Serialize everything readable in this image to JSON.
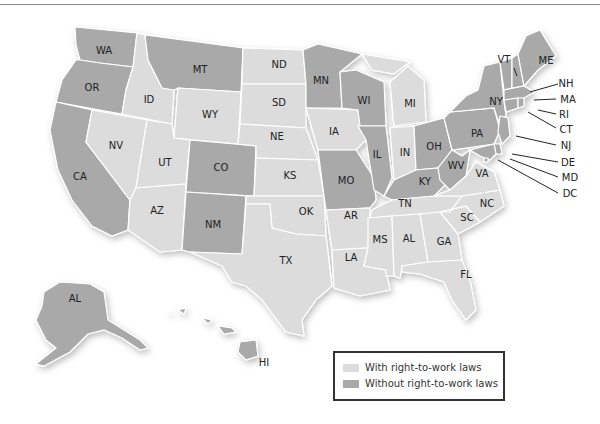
{
  "map": {
    "title": "",
    "colors": {
      "with_rtw": "#dcdcdc",
      "without_rtw": "#a9a9a9",
      "border": "#ffffff"
    },
    "legend": {
      "items": [
        {
          "label": "With right-to-work laws",
          "color": "#dcdcdc"
        },
        {
          "label": "Without right-to-work laws",
          "color": "#a9a9a9"
        }
      ]
    },
    "states": {
      "WA": "without",
      "OR": "without",
      "CA": "without",
      "ID": "with",
      "NV": "with",
      "MT": "without",
      "WY": "with",
      "UT": "with",
      "AZ": "with",
      "CO": "without",
      "NM": "without",
      "ND": "with",
      "SD": "with",
      "NE": "with",
      "KS": "with",
      "OK": "with",
      "TX": "with",
      "MN": "without",
      "IA": "with",
      "MO": "without",
      "AR": "with",
      "LA": "with",
      "WI": "without",
      "IL": "without",
      "MI": "with",
      "IN": "with",
      "OH": "without",
      "KY": "without",
      "TN": "with",
      "MS": "with",
      "AL": "with",
      "GA": "with",
      "FL": "with",
      "SC": "with",
      "NC": "with",
      "VA": "with",
      "WV": "without",
      "PA": "without",
      "NY": "without",
      "VT": "without",
      "ME": "without",
      "NH": "without",
      "MA": "without",
      "RI": "without",
      "CT": "without",
      "NJ": "without",
      "DE": "without",
      "MD": "without",
      "DC": "without",
      "AK": "without",
      "HI": "without"
    },
    "labels": {
      "WA": "WA",
      "OR": "OR",
      "CA": "CA",
      "ID": "ID",
      "NV": "NV",
      "MT": "MT",
      "WY": "WY",
      "UT": "UT",
      "AZ": "AZ",
      "CO": "CO",
      "NM": "NM",
      "ND": "ND",
      "SD": "SD",
      "NE": "NE",
      "KS": "KS",
      "OK": "OK",
      "TX": "TX",
      "MN": "MN",
      "IA": "IA",
      "MO": "MO",
      "AR": "AR",
      "LA": "LA",
      "WI": "WI",
      "IL": "IL",
      "MI": "MI",
      "IN": "IN",
      "OH": "OH",
      "KY": "KY",
      "TN": "TN",
      "MS": "MS",
      "AL": "AL",
      "GA": "GA",
      "FL": "FL",
      "SC": "SC",
      "NC": "NC",
      "VA": "VA",
      "WV": "WV",
      "PA": "PA",
      "NY": "NY",
      "VT": "VT",
      "ME": "ME",
      "NH": "NH",
      "MA": "MA",
      "RI": "RI",
      "CT": "CT",
      "NJ": "NJ",
      "DE": "DE",
      "MD": "MD",
      "DC": "DC",
      "AK": "AL",
      "HI": "HI"
    }
  }
}
